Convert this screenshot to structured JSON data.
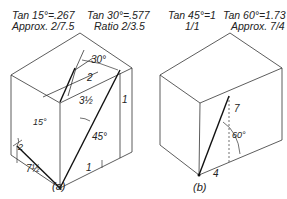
{
  "header": {
    "tan15": {
      "line1": "Tan 15°=.267",
      "line2": "Approx. 2/7.5"
    },
    "tan30": {
      "line1": "Tan 30°=.577",
      "line2": "Ratio 2/3.5"
    },
    "tan45": {
      "line1": "Tan 45°=1",
      "line2": "1/1"
    },
    "tan60": {
      "line1": "Tan 60°=1.73",
      "line2": "Approx. 7/4"
    }
  },
  "figure_a": {
    "caption": "(a)",
    "labels": {
      "angle30": "30°",
      "two_top": "2",
      "three_half": "3½",
      "one_right": "1",
      "angle15": "15°",
      "two_left": "2",
      "seven_half": "7½",
      "angle45": "45°",
      "one_bottom": "1"
    }
  },
  "figure_b": {
    "caption": "(b)",
    "labels": {
      "seven": "7",
      "angle60": "60°",
      "four": "4"
    }
  },
  "colors": {
    "line": "#222222",
    "background": "#ffffff"
  }
}
